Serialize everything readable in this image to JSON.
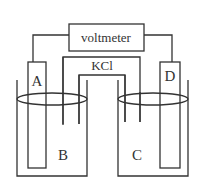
{
  "diagram": {
    "voltmeter_label": "voltmeter",
    "salt_bridge_label": "KCl",
    "electrode_left_label": "A",
    "electrode_right_label": "D",
    "solution_left_label": "B",
    "solution_right_label": "C",
    "colors": {
      "line": "#333333",
      "background": "#ffffff"
    }
  }
}
